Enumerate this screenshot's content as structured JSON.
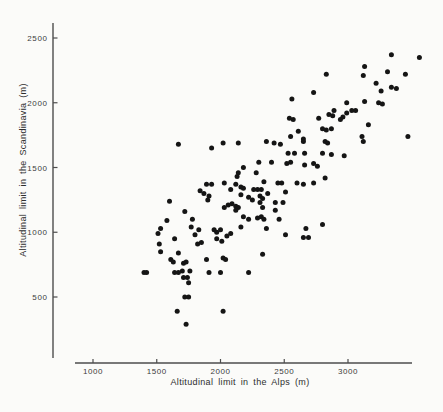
{
  "figure": {
    "background": "#fbfbf9",
    "ink_color": "#4d4d4d",
    "dot_color": "#151515"
  },
  "chart_data": {
    "type": "scatter",
    "title": "",
    "xlabel": "Altitudinal limit in the Alps (m)",
    "ylabel": "Altitudinal limit in the Scandinavia (m)",
    "x_ticks": [
      1000,
      1500,
      2000,
      2500,
      3000
    ],
    "y_ticks": [
      500,
      1000,
      1500,
      2000,
      2500
    ],
    "xlim": [
      860,
      3500
    ],
    "ylim": [
      30,
      2620
    ],
    "grid": false,
    "legend": null,
    "marker": "filled-circle",
    "points": [
      [
        3340,
        2370
      ],
      [
        3560,
        2350
      ],
      [
        3130,
        2280
      ],
      [
        3120,
        2210
      ],
      [
        3310,
        2240
      ],
      [
        3450,
        2220
      ],
      [
        3220,
        2150
      ],
      [
        3260,
        2090
      ],
      [
        3340,
        2120
      ],
      [
        3380,
        2110
      ],
      [
        3130,
        2010
      ],
      [
        2990,
        2000
      ],
      [
        3240,
        2000
      ],
      [
        3270,
        1990
      ],
      [
        3030,
        1940
      ],
      [
        3060,
        1940
      ],
      [
        2990,
        1920
      ],
      [
        2960,
        1890
      ],
      [
        2940,
        1870
      ],
      [
        3160,
        1830
      ],
      [
        3110,
        1740
      ],
      [
        3470,
        1740
      ],
      [
        3120,
        1700
      ],
      [
        2970,
        1590
      ],
      [
        2830,
        2220
      ],
      [
        2730,
        2080
      ],
      [
        2560,
        2030
      ],
      [
        2890,
        1940
      ],
      [
        2850,
        1910
      ],
      [
        2880,
        1900
      ],
      [
        2770,
        1880
      ],
      [
        2540,
        1880
      ],
      [
        2570,
        1870
      ],
      [
        2800,
        1800
      ],
      [
        2830,
        1790
      ],
      [
        2870,
        1800
      ],
      [
        2610,
        1780
      ],
      [
        2550,
        1740
      ],
      [
        2650,
        1720
      ],
      [
        2140,
        1690
      ],
      [
        2360,
        1700
      ],
      [
        2420,
        1690
      ],
      [
        2470,
        1680
      ],
      [
        2650,
        1700
      ],
      [
        2820,
        1700
      ],
      [
        2840,
        1690
      ],
      [
        2530,
        1610
      ],
      [
        2580,
        1610
      ],
      [
        2660,
        1610
      ],
      [
        2800,
        1610
      ],
      [
        2870,
        1600
      ],
      [
        2300,
        1540
      ],
      [
        2400,
        1540
      ],
      [
        2520,
        1530
      ],
      [
        2550,
        1540
      ],
      [
        2660,
        1520
      ],
      [
        2730,
        1530
      ],
      [
        2760,
        1510
      ],
      [
        2180,
        1500
      ],
      [
        2280,
        1460
      ],
      [
        2340,
        1390
      ],
      [
        2450,
        1380
      ],
      [
        2480,
        1380
      ],
      [
        2600,
        1380
      ],
      [
        2650,
        1370
      ],
      [
        2730,
        1380
      ],
      [
        2820,
        1420
      ],
      [
        2160,
        1350
      ],
      [
        2180,
        1340
      ],
      [
        2260,
        1330
      ],
      [
        2290,
        1330
      ],
      [
        2320,
        1330
      ],
      [
        2510,
        1310
      ],
      [
        2370,
        1300
      ],
      [
        2160,
        1290
      ],
      [
        2220,
        1270
      ],
      [
        2250,
        1250
      ],
      [
        2310,
        1280
      ],
      [
        2330,
        1260
      ],
      [
        2310,
        1230
      ],
      [
        2430,
        1230
      ],
      [
        2490,
        1230
      ],
      [
        2120,
        1200
      ],
      [
        2140,
        1190
      ],
      [
        2120,
        1170
      ],
      [
        2330,
        1190
      ],
      [
        2430,
        1170
      ],
      [
        2180,
        1120
      ],
      [
        2220,
        1100
      ],
      [
        2290,
        1110
      ],
      [
        2320,
        1120
      ],
      [
        2340,
        1100
      ],
      [
        2460,
        1100
      ],
      [
        2160,
        1040
      ],
      [
        2360,
        1030
      ],
      [
        2670,
        1030
      ],
      [
        2510,
        980
      ],
      [
        2650,
        960
      ],
      [
        2690,
        960
      ],
      [
        2800,
        1060
      ],
      [
        1670,
        1680
      ],
      [
        1930,
        1650
      ],
      [
        2020,
        1690
      ],
      [
        1600,
        1240
      ],
      [
        1840,
        1320
      ],
      [
        1870,
        1300
      ],
      [
        1890,
        1370
      ],
      [
        1930,
        1370
      ],
      [
        1910,
        1280
      ],
      [
        1900,
        1250
      ],
      [
        2030,
        1380
      ],
      [
        2080,
        1330
      ],
      [
        2060,
        1210
      ],
      [
        2090,
        1220
      ],
      [
        2030,
        1190
      ],
      [
        2130,
        1430
      ],
      [
        2140,
        1460
      ],
      [
        2120,
        1370
      ],
      [
        1720,
        1160
      ],
      [
        1580,
        1090
      ],
      [
        1530,
        1030
      ],
      [
        1510,
        990
      ],
      [
        1780,
        1100
      ],
      [
        1770,
        1040
      ],
      [
        1830,
        1020
      ],
      [
        1800,
        980
      ],
      [
        1950,
        1020
      ],
      [
        1970,
        1000
      ],
      [
        2000,
        1020
      ],
      [
        2050,
        970
      ],
      [
        2080,
        990
      ],
      [
        1640,
        950
      ],
      [
        1970,
        950
      ],
      [
        1520,
        910
      ],
      [
        1530,
        850
      ],
      [
        1670,
        840
      ],
      [
        1820,
        910
      ],
      [
        1850,
        920
      ],
      [
        2010,
        930
      ],
      [
        1610,
        790
      ],
      [
        1630,
        770
      ],
      [
        1710,
        760
      ],
      [
        1730,
        770
      ],
      [
        1890,
        790
      ],
      [
        2020,
        800
      ],
      [
        2040,
        790
      ],
      [
        1400,
        690
      ],
      [
        1420,
        690
      ],
      [
        1640,
        690
      ],
      [
        1670,
        690
      ],
      [
        1700,
        700
      ],
      [
        1760,
        700
      ],
      [
        1910,
        690
      ],
      [
        2000,
        690
      ],
      [
        1710,
        650
      ],
      [
        1740,
        650
      ],
      [
        1750,
        610
      ],
      [
        1720,
        500
      ],
      [
        1750,
        500
      ],
      [
        1660,
        390
      ],
      [
        2020,
        390
      ],
      [
        1730,
        290
      ],
      [
        2330,
        830
      ],
      [
        2220,
        690
      ]
    ]
  }
}
